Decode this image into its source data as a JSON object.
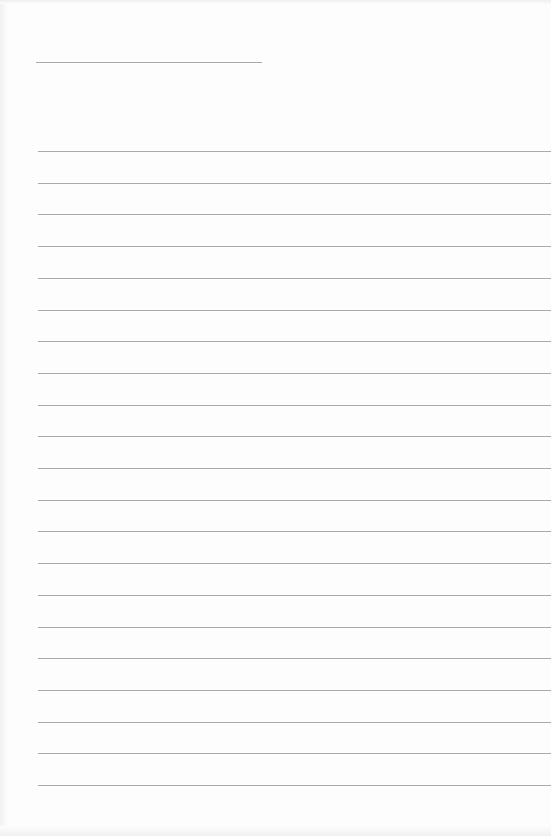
{
  "page": {
    "type": "lined-paper",
    "background": "#fdfdfd",
    "line_color": "#a9a9a9",
    "header_line": {
      "x": 36,
      "y": 62,
      "width": 226
    },
    "ruled_lines": {
      "x": 38,
      "start_y": 151,
      "spacing": 31.7,
      "count": 21
    }
  }
}
